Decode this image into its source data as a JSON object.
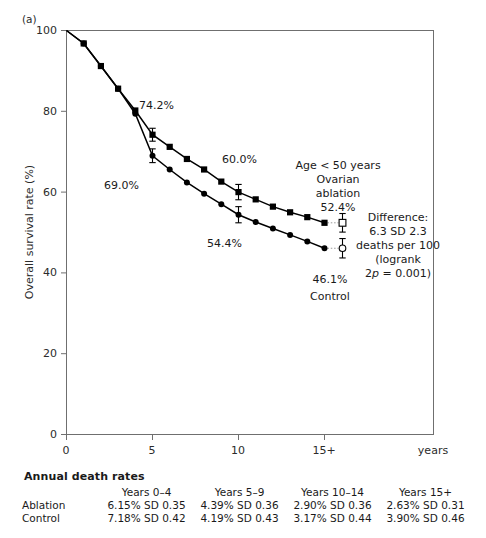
{
  "panel": {
    "letter": "(a)"
  },
  "axes": {
    "ylabel": "Overall survival rate (%)",
    "yticks": [
      "0",
      "20",
      "40",
      "60",
      "80",
      "100"
    ],
    "xticks": [
      "0",
      "5",
      "10",
      "15+"
    ],
    "xunit": "years"
  },
  "annotations": {
    "ablation_5yr": "74.2%",
    "control_5yr": "69.0%",
    "ablation_10yr": "60.0%",
    "control_10yr": "54.4%",
    "group_line1": "Age < 50 years",
    "group_line2": "Ovarian",
    "group_line3": "ablation",
    "group_value": "52.4%",
    "control_value": "46.1%",
    "control_label": "Control",
    "diff_line1": "Difference:",
    "diff_line2": "6.3 SD 2.3",
    "diff_line3": "deaths per 100",
    "diff_line4": "(logrank",
    "diff_line5_pre": "2",
    "diff_line5_ital": "p",
    "diff_line5_post": " = 0.001)"
  },
  "table": {
    "title": "Annual death rates",
    "columns": [
      "Years 0–4",
      "Years 5–9",
      "Years 10–14",
      "Years 15+"
    ],
    "rows": [
      {
        "label": "Ablation",
        "values": [
          "6.15% SD 0.35",
          "4.39% SD 0.36",
          "2.90% SD 0.36",
          "2.63% SD 0.31"
        ]
      },
      {
        "label": "Control",
        "values": [
          "7.18% SD 0.42",
          "4.19% SD 0.43",
          "3.17% SD 0.44",
          "3.90% SD 0.46"
        ]
      }
    ]
  },
  "chart_data": {
    "type": "line",
    "title": "",
    "xlabel": "years",
    "ylabel": "Overall survival rate (%)",
    "xlim": [
      0,
      21.4
    ],
    "ylim": [
      0,
      100
    ],
    "grid": false,
    "legend": "annotated-inline",
    "colors": {
      "ablation": "#000000",
      "control": "#000000"
    },
    "x": [
      0,
      1,
      2,
      3,
      4,
      5,
      6,
      7,
      8,
      9,
      10,
      11,
      12,
      13,
      14,
      15
    ],
    "series": [
      {
        "name": "Ovarian ablation",
        "marker": "square",
        "values": [
          100.0,
          96.8,
          91.2,
          85.6,
          80.2,
          74.2,
          71.2,
          68.2,
          65.6,
          62.6,
          60.0,
          58.2,
          56.4,
          55.0,
          53.8,
          52.4
        ],
        "labelled_points": [
          {
            "x": 5,
            "y": 74.2,
            "label": "74.2%"
          },
          {
            "x": 10,
            "y": 60.0,
            "label": "60.0%"
          },
          {
            "x": 15,
            "y": 52.4,
            "label": "52.4%"
          }
        ],
        "error_bars": [
          {
            "x": 5,
            "y": 74.2,
            "sd": 1.6
          },
          {
            "x": 10,
            "y": 60.0,
            "sd": 1.9
          },
          {
            "x": 15,
            "y": 52.4,
            "sd": 2.3
          }
        ]
      },
      {
        "name": "Control",
        "marker": "circle",
        "values": [
          100.0,
          96.8,
          91.2,
          85.6,
          79.4,
          69.0,
          65.6,
          62.4,
          59.6,
          57.0,
          54.4,
          52.6,
          51.0,
          49.4,
          47.8,
          46.1
        ],
        "labelled_points": [
          {
            "x": 5,
            "y": 69.0,
            "label": "69.0%"
          },
          {
            "x": 10,
            "y": 54.4,
            "label": "54.4%"
          },
          {
            "x": 15,
            "y": 46.1,
            "label": "46.1%"
          }
        ],
        "error_bars": [
          {
            "x": 5,
            "y": 69.0,
            "sd": 1.7
          },
          {
            "x": 10,
            "y": 54.4,
            "sd": 2.0
          },
          {
            "x": 15,
            "y": 46.1,
            "sd": 2.4
          }
        ]
      }
    ]
  }
}
